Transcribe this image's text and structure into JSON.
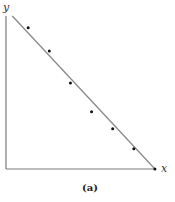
{
  "chart_data": {
    "type": "scatter",
    "title": "",
    "caption": "(a)",
    "xlabel": "x",
    "ylabel": "y",
    "xlim": [
      0,
      7.1
    ],
    "ylim": [
      0,
      7.2
    ],
    "grid": false,
    "points": [
      {
        "x": 1.05,
        "y": 6.65
      },
      {
        "x": 2.05,
        "y": 5.55
      },
      {
        "x": 3.05,
        "y": 4.05
      },
      {
        "x": 4.05,
        "y": 2.7
      },
      {
        "x": 5.05,
        "y": 1.9
      },
      {
        "x": 6.05,
        "y": 0.95
      },
      {
        "x": 7.05,
        "y": 0.0
      }
    ],
    "fit_line": {
      "x0": 0.3,
      "y0": 7.2,
      "x1": 7.05,
      "y1": 0.0
    }
  }
}
